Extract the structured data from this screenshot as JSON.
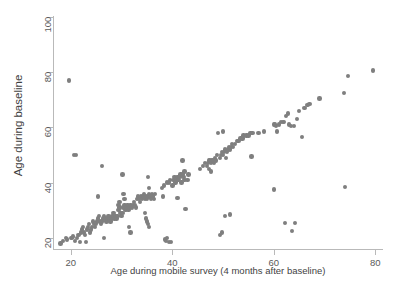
{
  "chart_data": {
    "type": "scatter",
    "title": "",
    "xlabel": "Age during mobile survey (4 months after baseline)",
    "ylabel": "Age during baseline",
    "xlim": [
      16.5,
      81.5
    ],
    "ylim": [
      16.0,
      101.0
    ],
    "xticks": [
      20,
      40,
      60,
      80
    ],
    "yticks": [
      20,
      40,
      60,
      80,
      100
    ],
    "xtick_labels": [
      "20",
      "40",
      "60",
      "80"
    ],
    "ytick_labels": [
      "20",
      "40",
      "60",
      "80",
      "100"
    ],
    "grid": false,
    "legend": null,
    "marker": {
      "shape": "circle",
      "color": "#7f7f7f",
      "size": 4.4
    },
    "series": [
      {
        "name": "participants",
        "points": [
          [
            18,
            18
          ],
          [
            18.5,
            19
          ],
          [
            19,
            20
          ],
          [
            19.3,
            19.5
          ],
          [
            19.6,
            77
          ],
          [
            20,
            20
          ],
          [
            20.2,
            20
          ],
          [
            20.4,
            20.5
          ],
          [
            20.6,
            50
          ],
          [
            21,
            50
          ],
          [
            20.8,
            19
          ],
          [
            21.2,
            20
          ],
          [
            21.5,
            21
          ],
          [
            21.8,
            18.5
          ],
          [
            22,
            22
          ],
          [
            22.2,
            23
          ],
          [
            22.4,
            24
          ],
          [
            22.6,
            22
          ],
          [
            22.8,
            21
          ],
          [
            23,
            18.5
          ],
          [
            23.2,
            23
          ],
          [
            23.4,
            24
          ],
          [
            23.6,
            25
          ],
          [
            23.8,
            22
          ],
          [
            24,
            23
          ],
          [
            24.2,
            24
          ],
          [
            24.4,
            26
          ],
          [
            24.6,
            25
          ],
          [
            24.8,
            24
          ],
          [
            25,
            25
          ],
          [
            25.2,
            26
          ],
          [
            25.4,
            27
          ],
          [
            25.6,
            28
          ],
          [
            25.8,
            26
          ],
          [
            25.4,
            35
          ],
          [
            26,
            25
          ],
          [
            26.2,
            26
          ],
          [
            26.4,
            27
          ],
          [
            26.6,
            28
          ],
          [
            26.8,
            27
          ],
          [
            26.2,
            46
          ],
          [
            26.5,
            20
          ],
          [
            27,
            26
          ],
          [
            27.2,
            27
          ],
          [
            27.4,
            28
          ],
          [
            27.6,
            27
          ],
          [
            27.8,
            26
          ],
          [
            28,
            27
          ],
          [
            28.2,
            28
          ],
          [
            28.4,
            29
          ],
          [
            28.6,
            27
          ],
          [
            28.8,
            28
          ],
          [
            29,
            27
          ],
          [
            29.2,
            28
          ],
          [
            29.4,
            30
          ],
          [
            29.6,
            31
          ],
          [
            29.8,
            29
          ],
          [
            29.4,
            32
          ],
          [
            29.6,
            33
          ],
          [
            30,
            28
          ],
          [
            30.2,
            29
          ],
          [
            30.4,
            31
          ],
          [
            30.6,
            32
          ],
          [
            30.8,
            30
          ],
          [
            30.2,
            43
          ],
          [
            30.4,
            36
          ],
          [
            30.6,
            34
          ],
          [
            31,
            31
          ],
          [
            31.2,
            32
          ],
          [
            31.4,
            30
          ],
          [
            31.6,
            31
          ],
          [
            31.8,
            32
          ],
          [
            32,
            31
          ],
          [
            32.2,
            32
          ],
          [
            32.4,
            33
          ],
          [
            32.6,
            32
          ],
          [
            32.8,
            31
          ],
          [
            31.5,
            24
          ],
          [
            31.8,
            22
          ],
          [
            33,
            34
          ],
          [
            33.2,
            35
          ],
          [
            33.4,
            34
          ],
          [
            33.6,
            33
          ],
          [
            33.8,
            35
          ],
          [
            34,
            34
          ],
          [
            34.2,
            35
          ],
          [
            34.4,
            36
          ],
          [
            34.6,
            34
          ],
          [
            34.8,
            35
          ],
          [
            35,
            34
          ],
          [
            35.2,
            35
          ],
          [
            35.4,
            36
          ],
          [
            35.6,
            35
          ],
          [
            35.8,
            34
          ],
          [
            35.2,
            42
          ],
          [
            35.4,
            38
          ],
          [
            34.8,
            27
          ],
          [
            35,
            26
          ],
          [
            35.2,
            25
          ],
          [
            35.4,
            24
          ],
          [
            34.6,
            29
          ],
          [
            36,
            36
          ],
          [
            36.2,
            35
          ],
          [
            36.4,
            34
          ],
          [
            36.6,
            36
          ],
          [
            38,
            38
          ],
          [
            38.4,
            39
          ],
          [
            38.2,
            35
          ],
          [
            38.6,
            19.5
          ],
          [
            38.8,
            19
          ],
          [
            39,
            20
          ],
          [
            39.4,
            18.5
          ],
          [
            39.8,
            18.5
          ],
          [
            39,
            40
          ],
          [
            39.4,
            40
          ],
          [
            39.6,
            41
          ],
          [
            40,
            39
          ],
          [
            40.2,
            41
          ],
          [
            40.4,
            42
          ],
          [
            40.6,
            40
          ],
          [
            40.8,
            41
          ],
          [
            41,
            42
          ],
          [
            41.2,
            41
          ],
          [
            41.4,
            42
          ],
          [
            41.6,
            43
          ],
          [
            41.8,
            40
          ],
          [
            42,
            43
          ],
          [
            42.2,
            42
          ],
          [
            42.4,
            41
          ],
          [
            42,
            48
          ],
          [
            42.4,
            44
          ],
          [
            41,
            34.5
          ],
          [
            42.6,
            30.5
          ],
          [
            43,
            41
          ],
          [
            43.2,
            43
          ],
          [
            45.5,
            45
          ],
          [
            46,
            46
          ],
          [
            46.4,
            47
          ],
          [
            46.8,
            46
          ],
          [
            47,
            47
          ],
          [
            47.2,
            48
          ],
          [
            47.4,
            48
          ],
          [
            47.6,
            47
          ],
          [
            47.8,
            48
          ],
          [
            48,
            48
          ],
          [
            48.2,
            47
          ],
          [
            48.4,
            49
          ],
          [
            48.6,
            48
          ],
          [
            48.8,
            50
          ],
          [
            47.2,
            45
          ],
          [
            47.6,
            44
          ],
          [
            49,
            58
          ],
          [
            50,
            58.5
          ],
          [
            49.4,
            49
          ],
          [
            49.6,
            50
          ],
          [
            49.8,
            51
          ],
          [
            50,
            50
          ],
          [
            50.2,
            51
          ],
          [
            50.4,
            52
          ],
          [
            50.6,
            49
          ],
          [
            50.8,
            51
          ],
          [
            51,
            52
          ],
          [
            51.2,
            53
          ],
          [
            51.4,
            52
          ],
          [
            51.6,
            53
          ],
          [
            51.8,
            54
          ],
          [
            52,
            53
          ],
          [
            52.4,
            54
          ],
          [
            52.8,
            55
          ],
          [
            49.4,
            21
          ],
          [
            49.8,
            22
          ],
          [
            50.4,
            28
          ],
          [
            51.4,
            28.5
          ],
          [
            53,
            55
          ],
          [
            53.4,
            56
          ],
          [
            53.8,
            56
          ],
          [
            54,
            57
          ],
          [
            54.6,
            57
          ],
          [
            55,
            57
          ],
          [
            55.4,
            58
          ],
          [
            55.8,
            58
          ],
          [
            55.6,
            49.5
          ],
          [
            57,
            58
          ],
          [
            58,
            58.5
          ],
          [
            60,
            61
          ],
          [
            60.2,
            61
          ],
          [
            60.4,
            60.5
          ],
          [
            60.6,
            58.5
          ],
          [
            60,
            37.5
          ],
          [
            61,
            61
          ],
          [
            61.4,
            62
          ],
          [
            61.8,
            62
          ],
          [
            62,
            62
          ],
          [
            62.4,
            64
          ],
          [
            62.8,
            65
          ],
          [
            62.2,
            25.5
          ],
          [
            63,
            61
          ],
          [
            63.4,
            60.5
          ],
          [
            63.6,
            22.5
          ],
          [
            64,
            60.5
          ],
          [
            64.2,
            25.5
          ],
          [
            64.6,
            63
          ],
          [
            65,
            66
          ],
          [
            65.6,
            56.5
          ],
          [
            66,
            67
          ],
          [
            66.6,
            68
          ],
          [
            67,
            68.5
          ],
          [
            69,
            70.5
          ],
          [
            73.8,
            72.5
          ],
          [
            74,
            38.5
          ],
          [
            74.6,
            78.5
          ],
          [
            79.5,
            80.5
          ]
        ]
      }
    ]
  },
  "xaxis": {
    "label": "Age during mobile survey (4 months after baseline)",
    "ticks": [
      "20",
      "40",
      "60",
      "80"
    ]
  },
  "yaxis": {
    "label": "Age during baseline",
    "ticks": [
      "20",
      "40",
      "60",
      "80",
      "100"
    ]
  },
  "caption": {
    "text": ""
  },
  "colors": {
    "marker": "#7f7f7f",
    "axis": "#b9b9b9",
    "text": "#4d4d4d"
  }
}
